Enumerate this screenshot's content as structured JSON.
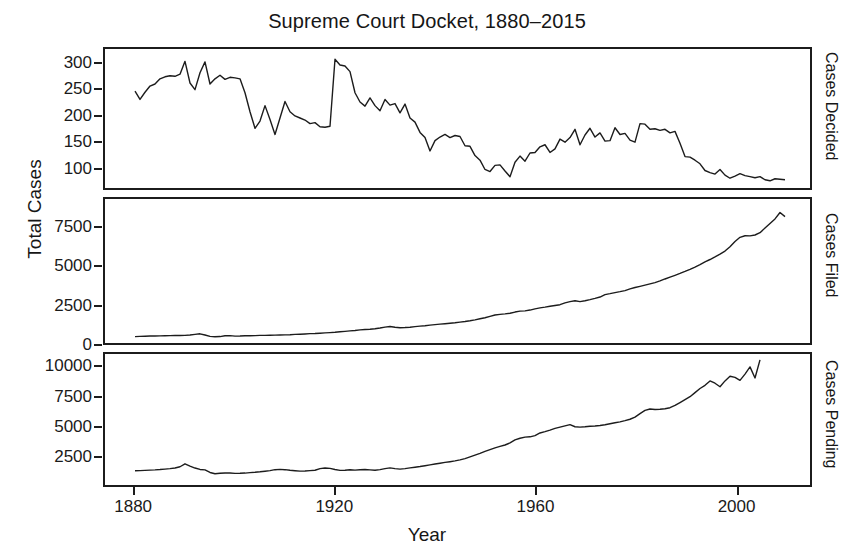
{
  "chart_data": {
    "type": "line",
    "title": "Supreme Court Docket, 1880–2015",
    "xlabel": "Year",
    "ylabel": "Total Cases",
    "xlim": [
      1874,
      2015
    ],
    "xticks": [
      1880,
      1920,
      1960,
      2000
    ],
    "grid": false,
    "legend": "none",
    "panels": [
      {
        "name": "Cases Decided",
        "right_label": "Cases Decided",
        "ylim": [
          60,
          330
        ],
        "yticks": [
          100,
          150,
          200,
          250,
          300
        ],
        "x": [
          1880,
          1881,
          1882,
          1883,
          1884,
          1885,
          1886,
          1887,
          1888,
          1889,
          1890,
          1891,
          1892,
          1893,
          1894,
          1895,
          1896,
          1897,
          1898,
          1899,
          1900,
          1901,
          1902,
          1903,
          1904,
          1905,
          1906,
          1907,
          1908,
          1909,
          1910,
          1911,
          1912,
          1913,
          1914,
          1915,
          1916,
          1917,
          1918,
          1919,
          1920,
          1921,
          1922,
          1923,
          1924,
          1925,
          1926,
          1927,
          1928,
          1929,
          1930,
          1931,
          1932,
          1933,
          1934,
          1935,
          1936,
          1937,
          1938,
          1939,
          1940,
          1941,
          1942,
          1943,
          1944,
          1945,
          1946,
          1947,
          1948,
          1949,
          1950,
          1951,
          1952,
          1953,
          1954,
          1955,
          1956,
          1957,
          1958,
          1959,
          1960,
          1961,
          1962,
          1963,
          1964,
          1965,
          1966,
          1967,
          1968,
          1969,
          1970,
          1971,
          1972,
          1973,
          1974,
          1975,
          1976,
          1977,
          1978,
          1979,
          1980,
          1981,
          1982,
          1983,
          1984,
          1985,
          1986,
          1987,
          1988,
          1989,
          1990,
          1991,
          1992,
          1993,
          1994,
          1995,
          1996,
          1997,
          1998,
          1999,
          2000,
          2001,
          2002,
          2003,
          2004,
          2005,
          2006,
          2007,
          2008,
          2009,
          2010
        ],
        "values": [
          248,
          232,
          246,
          258,
          262,
          272,
          276,
          278,
          277,
          281,
          306,
          264,
          251,
          284,
          305,
          262,
          272,
          279,
          271,
          275,
          274,
          272,
          245,
          208,
          176,
          190,
          220,
          193,
          164,
          196,
          228,
          208,
          200,
          196,
          192,
          185,
          187,
          179,
          178,
          180,
          310,
          299,
          297,
          286,
          245,
          227,
          219,
          235,
          220,
          210,
          232,
          221,
          224,
          206,
          223,
          196,
          188,
          168,
          158,
          132,
          152,
          159,
          164,
          158,
          162,
          160,
          142,
          141,
          123,
          114,
          96,
          92,
          104,
          105,
          93,
          82,
          110,
          122,
          112,
          128,
          129,
          140,
          144,
          129,
          136,
          155,
          149,
          158,
          174,
          144,
          163,
          176,
          159,
          167,
          151,
          152,
          177,
          164,
          166,
          153,
          149,
          185,
          184,
          174,
          175,
          172,
          174,
          167,
          170,
          147,
          121,
          120,
          114,
          107,
          94,
          90,
          87,
          96,
          85,
          79,
          83,
          88,
          84,
          82,
          80,
          82,
          76,
          74,
          78,
          77,
          76
        ]
      },
      {
        "name": "Cases Filed",
        "right_label": "Cases Filed",
        "ylim": [
          0,
          9400
        ],
        "yticks": [
          0,
          2500,
          5000,
          7500
        ],
        "x": [
          1880,
          1881,
          1882,
          1883,
          1884,
          1885,
          1886,
          1887,
          1888,
          1889,
          1890,
          1891,
          1892,
          1893,
          1894,
          1895,
          1896,
          1897,
          1898,
          1899,
          1900,
          1901,
          1902,
          1903,
          1904,
          1905,
          1906,
          1907,
          1908,
          1909,
          1910,
          1911,
          1912,
          1913,
          1914,
          1915,
          1916,
          1917,
          1918,
          1919,
          1920,
          1921,
          1922,
          1923,
          1924,
          1925,
          1926,
          1927,
          1928,
          1929,
          1930,
          1931,
          1932,
          1933,
          1934,
          1935,
          1936,
          1937,
          1938,
          1939,
          1940,
          1941,
          1942,
          1943,
          1944,
          1945,
          1946,
          1947,
          1948,
          1949,
          1950,
          1951,
          1952,
          1953,
          1954,
          1955,
          1956,
          1957,
          1958,
          1959,
          1960,
          1961,
          1962,
          1963,
          1964,
          1965,
          1966,
          1967,
          1968,
          1969,
          1970,
          1971,
          1972,
          1973,
          1974,
          1975,
          1976,
          1977,
          1978,
          1979,
          1980,
          1981,
          1982,
          1983,
          1984,
          1985,
          1986,
          1987,
          1988,
          1989,
          1990,
          1991,
          1992,
          1993,
          1994,
          1995,
          1996,
          1997,
          1998,
          1999,
          2000,
          2001,
          2002,
          2003,
          2004,
          2005,
          2006,
          2007,
          2008,
          2009,
          2010
        ],
        "values": [
          417,
          430,
          440,
          452,
          460,
          468,
          472,
          478,
          486,
          492,
          500,
          520,
          560,
          600,
          520,
          430,
          405,
          420,
          470,
          480,
          450,
          455,
          470,
          475,
          480,
          495,
          500,
          510,
          515,
          525,
          530,
          540,
          560,
          575,
          590,
          610,
          620,
          640,
          660,
          680,
          700,
          730,
          760,
          790,
          820,
          860,
          880,
          900,
          930,
          980,
          1040,
          1080,
          1030,
          1000,
          1010,
          1030,
          1070,
          1100,
          1130,
          1170,
          1200,
          1230,
          1260,
          1290,
          1320,
          1360,
          1400,
          1450,
          1510,
          1580,
          1650,
          1740,
          1830,
          1870,
          1900,
          1940,
          2020,
          2080,
          2100,
          2150,
          2230,
          2290,
          2340,
          2400,
          2450,
          2500,
          2620,
          2700,
          2760,
          2700,
          2760,
          2830,
          2910,
          3000,
          3160,
          3220,
          3290,
          3350,
          3420,
          3530,
          3620,
          3700,
          3780,
          3860,
          3940,
          4050,
          4180,
          4300,
          4420,
          4540,
          4670,
          4810,
          4960,
          5120,
          5300,
          5450,
          5620,
          5800,
          6000,
          6280,
          6630,
          6900,
          7000,
          6990,
          7050,
          7200,
          7500,
          7800,
          8100,
          8520,
          8250,
          7900,
          9060
        ]
      },
      {
        "name": "Cases Pending",
        "right_label": "Cases Pending",
        "ylim": [
          0,
          11200
        ],
        "yticks": [
          2500,
          5000,
          7500,
          10000
        ],
        "x": [
          1880,
          1881,
          1882,
          1883,
          1884,
          1885,
          1886,
          1887,
          1888,
          1889,
          1890,
          1891,
          1892,
          1893,
          1894,
          1895,
          1896,
          1897,
          1898,
          1899,
          1900,
          1901,
          1902,
          1903,
          1904,
          1905,
          1906,
          1907,
          1908,
          1909,
          1910,
          1911,
          1912,
          1913,
          1914,
          1915,
          1916,
          1917,
          1918,
          1919,
          1920,
          1921,
          1922,
          1923,
          1924,
          1925,
          1926,
          1927,
          1928,
          1929,
          1930,
          1931,
          1932,
          1933,
          1934,
          1935,
          1936,
          1937,
          1938,
          1939,
          1940,
          1941,
          1942,
          1943,
          1944,
          1945,
          1946,
          1947,
          1948,
          1949,
          1950,
          1951,
          1952,
          1953,
          1954,
          1955,
          1956,
          1957,
          1958,
          1959,
          1960,
          1961,
          1962,
          1963,
          1964,
          1965,
          1966,
          1967,
          1968,
          1969,
          1970,
          1971,
          1972,
          1973,
          1974,
          1975,
          1976,
          1977,
          1978,
          1979,
          1980,
          1981,
          1982,
          1983,
          1984,
          1985,
          1986,
          1987,
          1988,
          1989,
          1990,
          1991,
          1992,
          1993,
          1994,
          1995,
          1996,
          1997,
          1998,
          1999,
          2000,
          2001,
          2002,
          2003,
          2004,
          2005,
          2006,
          2007,
          2008,
          2009,
          2010
        ],
        "values": [
          1220,
          1230,
          1250,
          1270,
          1290,
          1320,
          1360,
          1400,
          1450,
          1560,
          1810,
          1620,
          1450,
          1330,
          1290,
          1070,
          960,
          1000,
          1020,
          1030,
          990,
          1000,
          1020,
          1060,
          1090,
          1130,
          1180,
          1230,
          1310,
          1340,
          1310,
          1260,
          1220,
          1190,
          1200,
          1230,
          1260,
          1400,
          1450,
          1420,
          1330,
          1250,
          1260,
          1300,
          1270,
          1300,
          1320,
          1290,
          1260,
          1310,
          1400,
          1460,
          1400,
          1360,
          1400,
          1460,
          1520,
          1580,
          1650,
          1720,
          1790,
          1860,
          1930,
          1990,
          2060,
          2150,
          2260,
          2400,
          2550,
          2700,
          2870,
          3020,
          3180,
          3300,
          3420,
          3600,
          3860,
          4000,
          4090,
          4120,
          4220,
          4450,
          4560,
          4690,
          4840,
          4950,
          5060,
          5160,
          4980,
          4950,
          4980,
          5020,
          5050,
          5090,
          5150,
          5240,
          5320,
          5400,
          5500,
          5620,
          5800,
          6100,
          6380,
          6500,
          6450,
          6480,
          6520,
          6610,
          6800,
          7050,
          7300,
          7550,
          7900,
          8250,
          8520,
          8900,
          8700,
          8400,
          8900,
          9300,
          9200,
          8950,
          9480,
          10100,
          9150,
          10700
        ]
      }
    ]
  }
}
